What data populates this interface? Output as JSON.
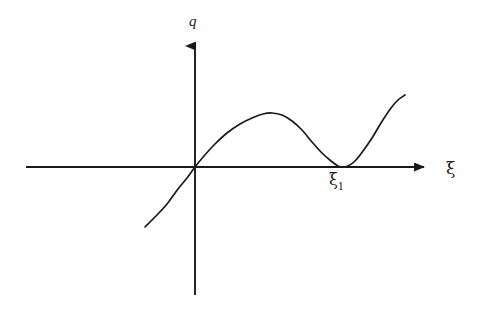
{
  "figure": {
    "background_color": "#ffffff",
    "stroke_color": "#1a1a1a",
    "width": 482,
    "height": 325
  },
  "labels": {
    "y_axis": "q",
    "x_axis": "ξ",
    "root_symbol": "ξ",
    "root_subscript": "1"
  },
  "chart_data": {
    "type": "line",
    "title": "",
    "xlabel": "ξ",
    "ylabel": "q",
    "grid": false,
    "legend": null,
    "axes": {
      "origin_px": [
        195,
        167
      ],
      "x_axis_from_px": [
        26,
        167
      ],
      "x_axis_to_px": [
        432,
        167
      ],
      "y_axis_from_px": [
        195,
        295
      ],
      "y_axis_to_px": [
        195,
        36
      ],
      "arrowheads": [
        "x-positive",
        "y-positive"
      ],
      "tick_labels_x": [
        "ξ₁"
      ],
      "tick_labels_y": []
    },
    "annotations": [
      {
        "text": "ξ₁",
        "meaning": "double root where q touches the ξ axis tangentially",
        "x_px": 342,
        "y_px": 167
      }
    ],
    "series": [
      {
        "name": "q(ξ)",
        "description": "cubic-like curve passing through the origin, rising to a local maximum, falling to a tangential minimum on the axis at ξ₁, then rising steeply",
        "points_px": [
          [
            145,
            227
          ],
          [
            156,
            216
          ],
          [
            167,
            204
          ],
          [
            178,
            189
          ],
          [
            187,
            178
          ],
          [
            195,
            167
          ],
          [
            204,
            156
          ],
          [
            215,
            144
          ],
          [
            227,
            133
          ],
          [
            240,
            124
          ],
          [
            252,
            118
          ],
          [
            263,
            114
          ],
          [
            272,
            113
          ],
          [
            282,
            115
          ],
          [
            292,
            121
          ],
          [
            302,
            130
          ],
          [
            312,
            142
          ],
          [
            322,
            153
          ],
          [
            331,
            161
          ],
          [
            338,
            166
          ],
          [
            342,
            167
          ],
          [
            348,
            166
          ],
          [
            355,
            161
          ],
          [
            363,
            151
          ],
          [
            372,
            138
          ],
          [
            381,
            123
          ],
          [
            391,
            108
          ],
          [
            398,
            100
          ],
          [
            405,
            95
          ]
        ],
        "key_points": {
          "left_endpoint_px": [
            145,
            227
          ],
          "zero_crossing_px": [
            195,
            167
          ],
          "local_maximum_px": [
            272,
            113
          ],
          "tangential_minimum_px": [
            342,
            167
          ],
          "right_endpoint_px": [
            405,
            95
          ]
        }
      }
    ]
  }
}
